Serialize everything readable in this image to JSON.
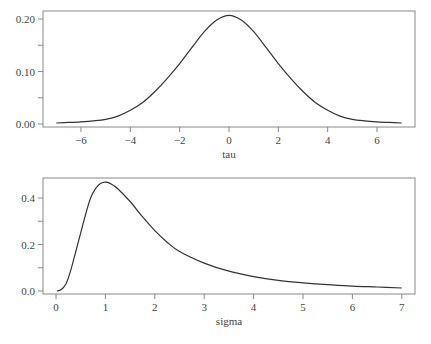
{
  "chart_data": [
    {
      "type": "line",
      "title": "",
      "xlabel": "tau",
      "ylabel": "",
      "xlim": [
        -7.5,
        7.5
      ],
      "ylim": [
        0,
        0.21
      ],
      "x_ticks": [
        -6,
        -4,
        -2,
        0,
        2,
        4,
        6
      ],
      "x_tick_labels": [
        "−6",
        "−4",
        "−2",
        "0",
        "2",
        "4",
        "6"
      ],
      "y_ticks": [
        0.0,
        0.05,
        0.1,
        0.15,
        0.2
      ],
      "y_tick_labels": [
        "0.00",
        "",
        "0.10",
        "",
        "0.20"
      ],
      "grid": false,
      "legend": null,
      "series": [
        {
          "name": "density(tau)",
          "x": [
            -7,
            -6.5,
            -6,
            -5.5,
            -5,
            -4.5,
            -4,
            -3.5,
            -3,
            -2.5,
            -2,
            -1.5,
            -1,
            -0.5,
            0,
            0.5,
            1,
            1.5,
            2,
            2.5,
            3,
            3.5,
            4,
            4.5,
            5,
            5.5,
            6,
            6.5,
            7
          ],
          "values": [
            0.002,
            0.003,
            0.004,
            0.006,
            0.009,
            0.015,
            0.026,
            0.041,
            0.062,
            0.087,
            0.115,
            0.146,
            0.176,
            0.198,
            0.207,
            0.198,
            0.176,
            0.146,
            0.115,
            0.087,
            0.062,
            0.041,
            0.026,
            0.015,
            0.009,
            0.006,
            0.004,
            0.003,
            0.002
          ]
        }
      ]
    },
    {
      "type": "line",
      "title": "",
      "xlabel": "sigma",
      "ylabel": "",
      "xlim": [
        -0.25,
        7.25
      ],
      "ylim": [
        0,
        0.47
      ],
      "x_ticks": [
        0,
        1,
        2,
        3,
        4,
        5,
        6,
        7
      ],
      "x_tick_labels": [
        "0",
        "1",
        "2",
        "3",
        "4",
        "5",
        "6",
        "7"
      ],
      "y_ticks": [
        0.0,
        0.1,
        0.2,
        0.3,
        0.4
      ],
      "y_tick_labels": [
        "0.0",
        "",
        "0.2",
        "",
        "0.4"
      ],
      "grid": false,
      "legend": null,
      "series": [
        {
          "name": "density(sigma)",
          "x": [
            0.02,
            0.1,
            0.2,
            0.3,
            0.4,
            0.5,
            0.6,
            0.7,
            0.8,
            0.9,
            1.0,
            1.1,
            1.25,
            1.5,
            1.75,
            2.0,
            2.25,
            2.5,
            3.0,
            3.5,
            4.0,
            4.5,
            5.0,
            5.5,
            6.0,
            6.5,
            7.0
          ],
          "values": [
            0.0,
            0.005,
            0.03,
            0.09,
            0.17,
            0.25,
            0.33,
            0.4,
            0.44,
            0.462,
            0.468,
            0.462,
            0.44,
            0.385,
            0.32,
            0.26,
            0.21,
            0.17,
            0.12,
            0.085,
            0.062,
            0.046,
            0.035,
            0.027,
            0.021,
            0.017,
            0.013
          ]
        }
      ]
    }
  ],
  "panels": {
    "top": {
      "xlabel": "tau"
    },
    "bottom": {
      "xlabel": "sigma"
    }
  },
  "colors": {
    "line": "#333333",
    "frame": "#888888",
    "text": "#444444"
  }
}
